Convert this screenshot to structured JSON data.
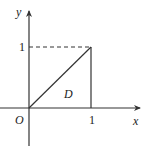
{
  "diagram": {
    "type": "coordinate-region",
    "axes": {
      "x_label": "x",
      "y_label": "y",
      "origin_label": "O"
    },
    "ticks": {
      "x_tick_label": "1",
      "y_tick_label": "1"
    },
    "region": {
      "label": "D",
      "vertices": [
        [
          0,
          0
        ],
        [
          1,
          0
        ],
        [
          1,
          1
        ]
      ],
      "description": "Triangle bounded by y = x, x = 1, and the x-axis"
    },
    "dashed_guide": "from (0,1) to (1,1)",
    "colors": {
      "line": "#333333",
      "background": "#ffffff"
    }
  }
}
